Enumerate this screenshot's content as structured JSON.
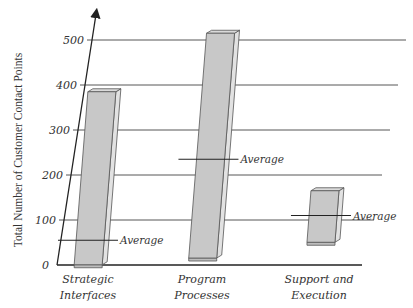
{
  "chart_data": {
    "type": "bar",
    "subtype": "floating-range-3d",
    "title": "",
    "xlabel": "",
    "ylabel": "Total Number of Customer Contact Points",
    "ylim": [
      0,
      500
    ],
    "yticks": [
      0,
      100,
      200,
      300,
      400,
      500
    ],
    "grid": true,
    "categories": [
      {
        "label_line1": "Strategic",
        "label_line2": "Interfaces"
      },
      {
        "label_line1": "Program",
        "label_line2": "Processes"
      },
      {
        "label_line1": "Support and",
        "label_line2": "Execution"
      }
    ],
    "series": [
      {
        "name": "Range low",
        "values": [
          5,
          20,
          55
        ]
      },
      {
        "name": "Range high",
        "values": [
          385,
          515,
          165
        ]
      },
      {
        "name": "Average",
        "values": [
          55,
          235,
          110
        ]
      }
    ],
    "annotation_label": "Average",
    "colors": {
      "bar_face": "#c8c8c8",
      "bar_side": "#e2e2e2",
      "bar_edge": "#555555",
      "grid": "#444444",
      "axis": "#222222"
    }
  }
}
